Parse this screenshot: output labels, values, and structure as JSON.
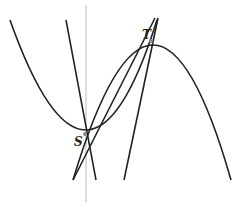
{
  "diagram": {
    "title": "",
    "points": [
      {
        "name": "S",
        "x": 85,
        "y": 134
      },
      {
        "name": "T",
        "x": 151,
        "y": 41
      }
    ],
    "labels": {
      "S": "S",
      "T": "T"
    },
    "curves": [
      {
        "id": "parabola-up",
        "type": "parabola",
        "opens": "up"
      },
      {
        "id": "parabola-down",
        "type": "parabola",
        "opens": "down"
      },
      {
        "id": "line-through-S",
        "type": "line"
      },
      {
        "id": "line-through-T-1",
        "type": "line"
      },
      {
        "id": "line-through-T-2",
        "type": "line"
      },
      {
        "id": "vertical-axis",
        "type": "axis"
      }
    ],
    "colors": {
      "curve": "#222222",
      "axis": "#bbbbbb",
      "point": "#888888"
    }
  }
}
